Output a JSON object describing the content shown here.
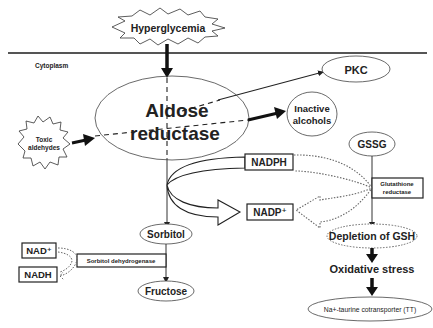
{
  "diagram": {
    "compartment_label": "Cytoplasm",
    "stimulus": "Hyperglycemia",
    "enzyme": {
      "line1": "Aldose",
      "line2": "reductase"
    },
    "toxic": {
      "line1": "Toxic",
      "line2": "aldehydes"
    },
    "pkc": "PKC",
    "inactive": {
      "line1": "Inactive",
      "line2": "alcohols"
    },
    "gssg": "GSSG",
    "nadph": "NADPH",
    "nadp": "NADP⁺",
    "glut_red": {
      "line1": "Glutathione",
      "line2": "reductase"
    },
    "depletion": "Depletion of GSH",
    "oxidative": "Oxidative stress",
    "tt": "Na+-taurine cotransporter (TT)",
    "sorbitol": "Sorbitol",
    "fructose": "Fructose",
    "sdh": "Sorbitol dehydrogenase",
    "nad": "NAD⁺",
    "nadh": "NADH",
    "colors": {
      "stroke": "#222222",
      "line": "#555555",
      "background": "#ffffff"
    }
  }
}
